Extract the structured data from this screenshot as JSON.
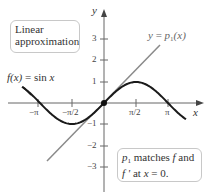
{
  "figure": {
    "title_box": {
      "line1": "Linear",
      "line2": "approximation"
    },
    "function_label": {
      "lhs": "f(x)",
      "eq": " = sin ",
      "var": "x"
    },
    "tangent_label": {
      "y": "y",
      "eq": " = ",
      "p": "p",
      "sub": "1",
      "arg": "(x)"
    },
    "note_box": {
      "p": "p",
      "sub": "1",
      "text1": " matches ",
      "f": "f",
      "text2": " and",
      "fprime": "f '",
      "text3": " at ",
      "x": "x",
      "text4": " = 0."
    },
    "axes": {
      "x_label": "x",
      "y_label": "y",
      "x_ticks": [
        "−π",
        "−π/2",
        "π/2",
        "π"
      ],
      "y_ticks": [
        "3",
        "2",
        "1",
        "−1",
        "−2",
        "−3"
      ]
    },
    "colors": {
      "curve": "#1a1a1a",
      "tangent": "#808080",
      "axis": "#666666",
      "box_border": "#c8c8c8"
    }
  }
}
